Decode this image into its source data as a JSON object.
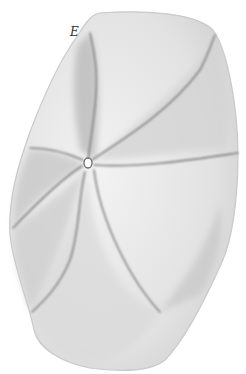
{
  "figure": {
    "label": "E",
    "colors": {
      "background": "#ffffff",
      "fill": "#e9e9e9",
      "shade": "#bdbdbd",
      "line": "#7a7a7a"
    }
  }
}
